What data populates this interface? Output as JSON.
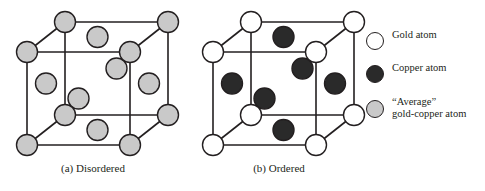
{
  "figure": {
    "type": "crystal-structure-diagram",
    "background": "#ffffff",
    "line_color": "#231f20"
  },
  "panels": [
    {
      "id": "a",
      "caption": "(a) Disordered",
      "atom_kind": "average",
      "description": "FCC unit cell with all sites occupied by average gold-copper atoms"
    },
    {
      "id": "b",
      "caption": "(b) Ordered",
      "corner_atom_kind": "gold",
      "face_atom_kind": "copper",
      "description": "FCC unit cell with gold atoms at corners and copper atoms at face centers"
    }
  ],
  "legend": {
    "items": [
      {
        "label": "Gold atom",
        "fill": "#ffffff",
        "stroke": "#231f20",
        "kind": "gold"
      },
      {
        "label": "Copper atom",
        "fill": "#2a2a2a",
        "stroke": "#231f20",
        "kind": "copper"
      },
      {
        "label": "“Average”\ngold-copper atom",
        "fill": "#c9c9c9",
        "stroke": "#231f20",
        "kind": "average"
      }
    ]
  },
  "colors": {
    "gold": "#ffffff",
    "copper": "#2a2a2a",
    "average": "#c9c9c9",
    "outline": "#231f20"
  },
  "geometry": {
    "note": "Oblique projection of a face-centered cubic unit cell",
    "cube_a_origin_x": 27,
    "cube_b_origin_x": 213,
    "front_left_x": 27,
    "front_right_x": 130,
    "front_top_y": 52,
    "front_bottom_y": 145,
    "depth_dx": 38,
    "depth_dy": -30,
    "atom_radius": 10.5,
    "corner_atoms": 8,
    "face_atoms": 6
  }
}
